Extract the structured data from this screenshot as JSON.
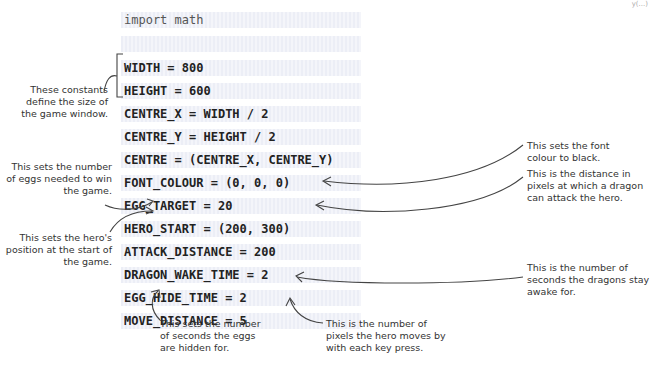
{
  "header": {
    "corner_text": "y(...)"
  },
  "code": {
    "lines": [
      "import math",
      "",
      "WIDTH = 800",
      "HEIGHT = 600",
      "CENTRE_X = WIDTH / 2",
      "CENTRE_Y = HEIGHT / 2",
      "CENTRE = (CENTRE_X, CENTRE_Y)",
      "FONT_COLOUR = (0, 0, 0)",
      "EGG_TARGET = 20",
      "HERO_START = (200, 300)",
      "ATTACK_DISTANCE = 200",
      "DRAGON_WAKE_TIME = 2",
      "EGG_HIDE_TIME = 2",
      "MOVE_DISTANCE = 5"
    ]
  },
  "annotations": {
    "window_size": "These constants define the size of the game window.",
    "egg_target": "This sets the number of eggs needed to win the game.",
    "hero_start": "This sets the hero's position at the start of the game.",
    "font_colour": "This sets the font colour to black.",
    "attack_distance": "This is the distance in pixels at which a dragon can attack the hero.",
    "dragon_wake": "This is the number of seconds the dragons stay awake for.",
    "egg_hide": "This sets the number of seconds the eggs are hidden for.",
    "move_distance": "This is the number of pixels the hero moves by with each key press."
  }
}
